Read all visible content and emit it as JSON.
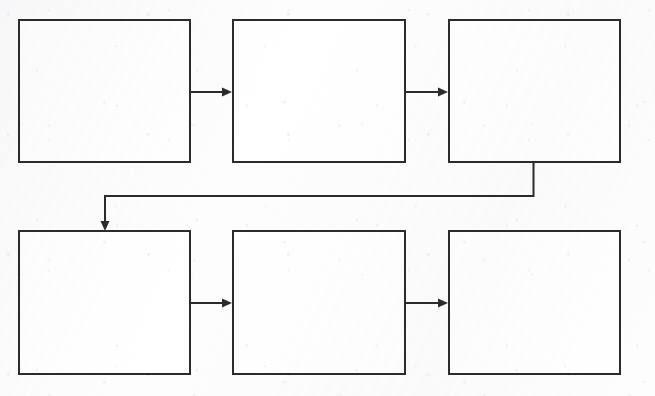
{
  "diagram": {
    "type": "flowchart",
    "orientation": "left-to-right, two rows, serpentine",
    "canvas": {
      "width": 655,
      "height": 396,
      "background_color": "#fdfdfd"
    },
    "style": {
      "box_fill": "#ffffff",
      "box_stroke": "#2b2b2b",
      "box_stroke_width": 2,
      "connector_stroke": "#2b2b2b",
      "connector_stroke_width": 2
    },
    "nodes": [
      {
        "id": "node-1",
        "label": "",
        "row": 1,
        "column": 1,
        "x": 19,
        "y": 20,
        "width": 171,
        "height": 142
      },
      {
        "id": "node-2",
        "label": "",
        "row": 1,
        "column": 2,
        "x": 233,
        "y": 20,
        "width": 172,
        "height": 142
      },
      {
        "id": "node-3",
        "label": "",
        "row": 1,
        "column": 3,
        "x": 449,
        "y": 20,
        "width": 171,
        "height": 142
      },
      {
        "id": "node-4",
        "label": "",
        "row": 2,
        "column": 1,
        "x": 19,
        "y": 231,
        "width": 171,
        "height": 143
      },
      {
        "id": "node-5",
        "label": "",
        "row": 2,
        "column": 2,
        "x": 233,
        "y": 231,
        "width": 172,
        "height": 143
      },
      {
        "id": "node-6",
        "label": "",
        "row": 2,
        "column": 3,
        "x": 449,
        "y": 231,
        "width": 171,
        "height": 143
      }
    ],
    "connectors": [
      {
        "id": "connector-1-2",
        "from": "node-1",
        "to": "node-2",
        "label": "",
        "kind": "straight-right",
        "arrowhead": true
      },
      {
        "id": "connector-2-3",
        "from": "node-2",
        "to": "node-3",
        "label": "",
        "kind": "straight-right",
        "arrowhead": true
      },
      {
        "id": "connector-3-4",
        "from": "node-3",
        "to": "node-4",
        "label": "",
        "kind": "elbow-down-left-down",
        "arrowhead": true
      },
      {
        "id": "connector-4-5",
        "from": "node-4",
        "to": "node-5",
        "label": "",
        "kind": "straight-right",
        "arrowhead": true
      },
      {
        "id": "connector-5-6",
        "from": "node-5",
        "to": "node-6",
        "label": "",
        "kind": "straight-right",
        "arrowhead": true
      }
    ]
  }
}
